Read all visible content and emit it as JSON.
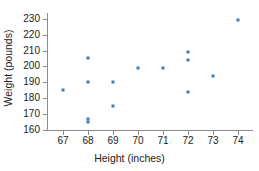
{
  "chart_data": {
    "type": "scatter",
    "title": "",
    "xlabel": "Height (inches)",
    "ylabel": "Weight (pounds)",
    "xlim": [
      66.4,
      74.6
    ],
    "ylim": [
      160,
      233
    ],
    "grid": false,
    "legend": false,
    "marker_color": "#3a7ebf",
    "axis_color": "#8b8b8b",
    "background_color": "#ffffff",
    "xticks": [
      67,
      68,
      69,
      70,
      71,
      72,
      73,
      74
    ],
    "xtick_labels": [
      "67",
      "68",
      "69",
      "70",
      "71",
      "72",
      "73",
      "74"
    ],
    "yticks": [
      160,
      170,
      180,
      190,
      200,
      210,
      220,
      230
    ],
    "ytick_labels": [
      "160",
      "170",
      "180",
      "190",
      "200",
      "210",
      "220",
      "230"
    ],
    "points": [
      {
        "x": 67,
        "y": 185
      },
      {
        "x": 68,
        "y": 205
      },
      {
        "x": 68,
        "y": 190
      },
      {
        "x": 68,
        "y": 167
      },
      {
        "x": 68,
        "y": 165
      },
      {
        "x": 69,
        "y": 190
      },
      {
        "x": 69,
        "y": 175
      },
      {
        "x": 70,
        "y": 199
      },
      {
        "x": 71,
        "y": 199
      },
      {
        "x": 72,
        "y": 209
      },
      {
        "x": 72,
        "y": 204
      },
      {
        "x": 72,
        "y": 184
      },
      {
        "x": 73,
        "y": 194
      },
      {
        "x": 74,
        "y": 229
      }
    ]
  }
}
